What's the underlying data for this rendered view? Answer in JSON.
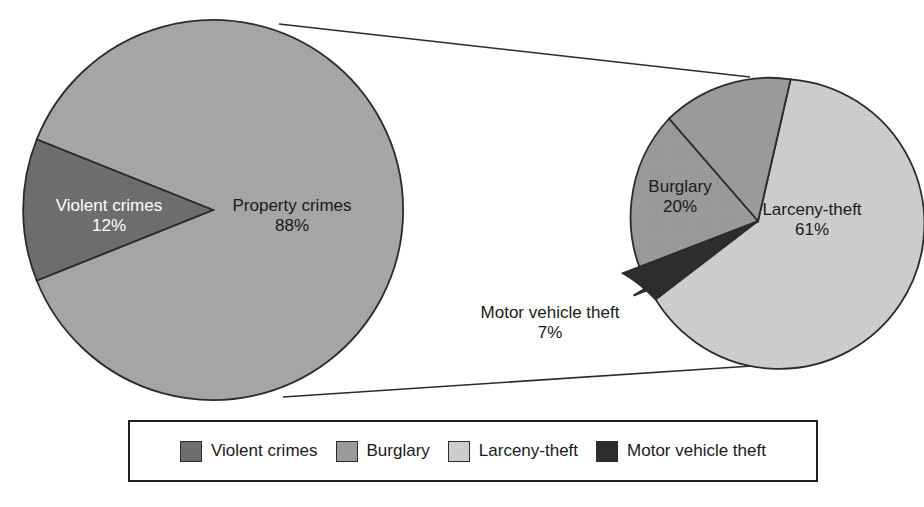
{
  "chart_data": [
    {
      "type": "pie",
      "name": "crime-overview-pie",
      "title": "",
      "categories": [
        "Property crimes",
        "Violent crimes"
      ],
      "values": [
        88,
        12
      ],
      "value_labels": [
        "88%",
        "12%"
      ],
      "colors": [
        "#a6a6a6",
        "#6e6e6e"
      ],
      "label_colors": [
        "#1a1a1a",
        "#ffffff"
      ],
      "center": [
        213,
        210
      ],
      "radius": 190,
      "legend": false
    },
    {
      "type": "pie",
      "name": "property-crime-breakdown-pie",
      "title": "",
      "categories": [
        "Larceny-theft",
        "Burglary",
        "Motor vehicle theft"
      ],
      "values": [
        61,
        20,
        7
      ],
      "value_labels": [
        "61%",
        "20%",
        "7%"
      ],
      "colors": [
        "#cdcdcd",
        "#9a9a9a",
        "#3a3a3a"
      ],
      "label_colors": [
        "#1a1a1a",
        "#1a1a1a",
        "#1a1a1a"
      ],
      "center": [
        758,
        221
      ],
      "radius": 145,
      "legend": false
    }
  ],
  "pie_left": {
    "slices": [
      {
        "label": "Property crimes",
        "percent": "88%"
      },
      {
        "label": "Violent crimes",
        "percent": "12%"
      }
    ]
  },
  "pie_right": {
    "slices": [
      {
        "label": "Larceny-theft",
        "percent": "61%"
      },
      {
        "label": "Burglary",
        "percent": "20%"
      },
      {
        "label": "Motor vehicle theft",
        "percent": "7%"
      }
    ]
  },
  "legend": {
    "position": "bottom",
    "items": [
      {
        "label": "Violent crimes",
        "color": "#6e6e6e"
      },
      {
        "label": "Burglary",
        "color": "#9a9a9a"
      },
      {
        "label": "Larceny-theft",
        "color": "#cdcdcd"
      },
      {
        "label": "Motor vehicle theft",
        "color": "#2d2d2d"
      }
    ]
  },
  "colors": {
    "violent_crimes": "#6e6e6e",
    "property_crimes": "#a6a6a6",
    "burglary": "#9a9a9a",
    "larceny_theft": "#cdcdcd",
    "motor_vehicle_theft": "#2d2d2d",
    "outline": "#2b2b2b",
    "background": "#ffffff"
  }
}
